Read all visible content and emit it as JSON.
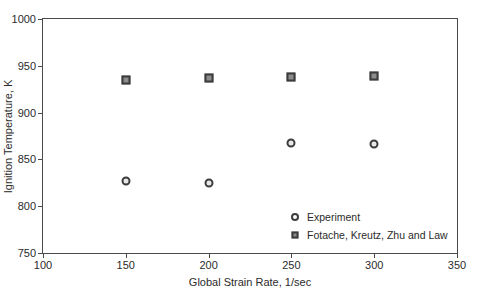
{
  "chart_data": {
    "type": "scatter",
    "title": "",
    "xlabel": "Global Strain Rate, 1/sec",
    "ylabel": "Ignition Temperature, K",
    "xlim": [
      100,
      350
    ],
    "ylim": [
      750,
      1000
    ],
    "xticks": [
      100,
      150,
      200,
      250,
      300,
      350
    ],
    "yticks": [
      750,
      800,
      850,
      900,
      950,
      1000
    ],
    "xtick_labels": [
      "100",
      "150",
      "200",
      "250",
      "300",
      "350"
    ],
    "ytick_labels": [
      "750",
      "800",
      "850",
      "900",
      "950",
      "1000"
    ],
    "grid": false,
    "legend_position": "lower-right-inside",
    "series": [
      {
        "name": "Experiment",
        "marker": "circle",
        "marker_edge_color": "#3c3c3c",
        "marker_face_color": "#e8e8e8",
        "x": [
          150,
          200,
          250,
          300
        ],
        "y": [
          827,
          825,
          867,
          866
        ]
      },
      {
        "name": "Fotache, Kreutz, Zhu and Law",
        "marker": "square",
        "marker_edge_color": "#3c3c3c",
        "marker_face_color": "#8c8c8c",
        "x": [
          150,
          200,
          250,
          300
        ],
        "y": [
          935,
          937,
          938,
          939
        ]
      }
    ]
  },
  "figure": {
    "background_color": "#ffffff",
    "frame_color": "#4a4a4a",
    "text_color": "#2b2b2b"
  }
}
